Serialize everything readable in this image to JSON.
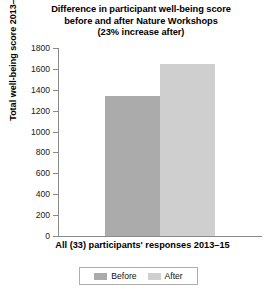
{
  "chart_data": {
    "type": "bar",
    "title": "Difference in participant well-being score before and after Nature Workshops (23% increase after)",
    "title_lines": [
      "Difference in participant well-being score",
      "before and after Nature Workshops",
      "(23% increase after)"
    ],
    "categories": [
      "All (33) participants' responses 2013–15"
    ],
    "series": [
      {
        "name": "Before",
        "values": [
          1340
        ],
        "color": "#ababab"
      },
      {
        "name": "After",
        "values": [
          1650
        ],
        "color": "#cfcfcf"
      }
    ],
    "xlabel": "All (33) participants' responses 2013–15",
    "ylabel": "Total well-being score 2013–15",
    "ylim": [
      0,
      1800
    ],
    "ytick_step": 200,
    "yticks": [
      0,
      200,
      400,
      600,
      800,
      1000,
      1200,
      1400,
      1600,
      1800
    ],
    "ytick_labels": [
      "0",
      "200",
      "400",
      "600",
      "800",
      "1000",
      "1200",
      "1400",
      "1600",
      "1800"
    ],
    "grid": false,
    "legend_position": "bottom",
    "legend_entries": [
      "Before",
      "After"
    ],
    "annotation": "23% increase after"
  },
  "axis": {
    "line_color": "#8a8a8a"
  }
}
